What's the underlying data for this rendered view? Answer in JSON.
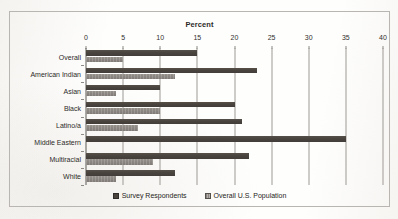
{
  "chart_data": {
    "type": "bar",
    "orientation": "horizontal",
    "title": "Percent",
    "xlabel": "Percent",
    "ylabel": "",
    "xlim": [
      0,
      40
    ],
    "xticks": [
      0,
      5,
      10,
      15,
      20,
      25,
      30,
      35,
      40
    ],
    "grid": true,
    "legend_position": "bottom-center",
    "categories": [
      "Overall",
      "American Indian",
      "Asian",
      "Black",
      "Latino/a",
      "Middle Eastern",
      "Multiracial",
      "White"
    ],
    "series": [
      {
        "name": "Survey Respondents",
        "color": "#4a443f",
        "values": [
          15,
          23,
          10,
          20,
          21,
          35,
          22,
          12
        ]
      },
      {
        "name": "Overall U.S. Population",
        "color": "#8a8580",
        "values": [
          5,
          12,
          4,
          10,
          7,
          0,
          9,
          4
        ]
      }
    ]
  }
}
